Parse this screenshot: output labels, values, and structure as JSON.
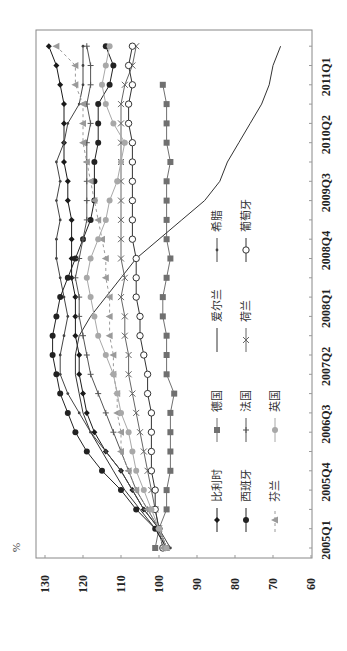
{
  "chart_data": {
    "type": "line",
    "orientation": "rotated-90-ccw",
    "title": "",
    "xlabel": "",
    "ylabel": "%",
    "ylim": [
      60,
      130
    ],
    "yticks": [
      60,
      70,
      80,
      90,
      100,
      110,
      120,
      130
    ],
    "xtick_labels": [
      "2005Q1",
      "2005Q4",
      "2006Q3",
      "2007Q2",
      "2008Q1",
      "2008Q4",
      "2009Q3",
      "2010Q2",
      "2011Q1"
    ],
    "x": [
      "2005Q1",
      "2005Q2",
      "2005Q3",
      "2005Q4",
      "2006Q1",
      "2006Q2",
      "2006Q3",
      "2006Q4",
      "2007Q1",
      "2007Q2",
      "2007Q3",
      "2007Q4",
      "2008Q1",
      "2008Q2",
      "2008Q3",
      "2008Q4",
      "2009Q1",
      "2009Q2",
      "2009Q3",
      "2009Q4",
      "2010Q1",
      "2010Q2",
      "2010Q3",
      "2010Q4",
      "2011Q1",
      "2011Q2",
      "2011Q3"
    ],
    "grid": false,
    "legend_position": "inside-lower-right",
    "series": [
      {
        "name": "比利时",
        "marker": "diamond",
        "color": "#1a1a1a",
        "dash": "",
        "values": [
          98,
          100,
          104,
          107,
          110,
          114,
          117,
          119,
          120,
          121,
          121,
          122,
          122,
          122,
          123,
          123,
          123,
          123,
          124,
          124,
          125,
          125,
          125,
          125,
          126,
          127,
          129
        ]
      },
      {
        "name": "德国",
        "marker": "square",
        "color": "#707070",
        "dash": "",
        "values": [
          101,
          100,
          98,
          98,
          97,
          97,
          97,
          97,
          96,
          98,
          98,
          98,
          99,
          99,
          98,
          97,
          98,
          98,
          98,
          98,
          97,
          98,
          98,
          98,
          99,
          null,
          null
        ]
      },
      {
        "name": "爱尔兰",
        "marker": "none",
        "color": "#333333",
        "dash": "",
        "values": [
          98,
          101,
          105,
          109,
          112,
          115,
          118,
          120,
          121,
          122,
          122,
          121,
          118,
          114,
          110,
          106,
          100,
          94,
          88,
          84,
          82,
          79,
          76,
          73,
          71,
          70,
          68
        ]
      },
      {
        "name": "希腊",
        "marker": "dot",
        "color": "#444444",
        "dash": "",
        "values": [
          97,
          100,
          104,
          107,
          110,
          114,
          118,
          121,
          124,
          126,
          126,
          125,
          124,
          125,
          126,
          127,
          127,
          126,
          127,
          126,
          127,
          125,
          124,
          121,
          120,
          120,
          120
        ]
      },
      {
        "name": "西班牙",
        "marker": "circle-filled",
        "color": "#222222",
        "dash": "",
        "values": [
          98,
          101,
          106,
          110,
          115,
          119,
          122,
          124,
          126,
          127,
          128,
          128,
          127,
          126,
          124,
          122,
          120,
          118,
          117,
          117,
          117,
          116,
          116,
          116,
          113,
          112,
          114
        ]
      },
      {
        "name": "法国",
        "marker": "plus",
        "color": "#555555",
        "dash": "",
        "values": [
          98,
          100,
          103,
          106,
          108,
          110,
          112,
          114,
          116,
          118,
          119,
          120,
          121,
          121,
          122,
          121,
          120,
          119,
          119,
          119,
          119,
          119,
          118,
          119,
          118,
          118,
          119
        ]
      },
      {
        "name": "荷兰",
        "marker": "x",
        "color": "#666666",
        "dash": "",
        "values": [
          98,
          100,
          101,
          102,
          103,
          104,
          105,
          106,
          107,
          108,
          108,
          109,
          109,
          110,
          109,
          110,
          110,
          110,
          110,
          110,
          110,
          110,
          110,
          110,
          109,
          107,
          106
        ]
      },
      {
        "name": "葡萄牙",
        "marker": "circle-open",
        "color": "#333333",
        "dash": "",
        "values": [
          99,
          100,
          101,
          101,
          102,
          102,
          102,
          102,
          103,
          103,
          104,
          105,
          105,
          106,
          106,
          106,
          107,
          107,
          107,
          107,
          107,
          107,
          108,
          108,
          107,
          108,
          107
        ]
      },
      {
        "name": "芬兰",
        "marker": "triangle",
        "color": "#9a9a9a",
        "dash": "3,3",
        "values": [
          99,
          100,
          103,
          106,
          108,
          110,
          110,
          111,
          111,
          112,
          112,
          113,
          113,
          113,
          114,
          114,
          115,
          116,
          117,
          118,
          119,
          120,
          120,
          120,
          122,
          122,
          127
        ]
      },
      {
        "name": "英国",
        "marker": "circle-filled",
        "color": "#a8a8a8",
        "dash": "",
        "values": [
          98,
          100,
          102,
          104,
          106,
          107,
          108,
          110,
          111,
          112,
          114,
          116,
          117,
          118,
          119,
          118,
          116,
          114,
          113,
          111,
          110,
          109,
          112,
          114,
          115,
          114,
          113
        ]
      }
    ]
  },
  "axis": {
    "unit_label": "%",
    "y_tick_labels": [
      "130",
      "120",
      "110",
      "100",
      "90",
      "80",
      "70",
      "60"
    ]
  },
  "legend": {
    "items": [
      {
        "label": "比利时",
        "marker": "diamond"
      },
      {
        "label": "德国",
        "marker": "square"
      },
      {
        "label": "爱尔兰",
        "marker": "none"
      },
      {
        "label": "希腊",
        "marker": "dot"
      },
      {
        "label": "西班牙",
        "marker": "circle-filled"
      },
      {
        "label": "法国",
        "marker": "plus"
      },
      {
        "label": "荷兰",
        "marker": "x"
      },
      {
        "label": "葡萄牙",
        "marker": "circle-open"
      },
      {
        "label": "芬兰",
        "marker": "triangle"
      },
      {
        "label": "英国",
        "marker": "circle-filled"
      }
    ]
  }
}
